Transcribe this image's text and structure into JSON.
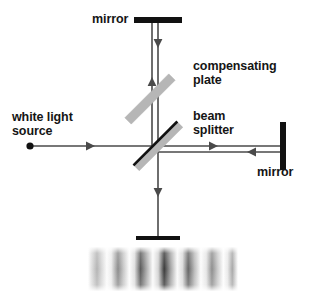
{
  "figure": {
    "background_color": "#ffffff",
    "line_color": "#4a4a4a",
    "solid_black": "#111111",
    "plate_gray": "#b3b3b3",
    "text_color": "#151515",
    "width": 312,
    "height": 308
  },
  "labels": {
    "mirror_top": "mirror",
    "compensating_plate": "compensating\nplate",
    "beam_splitter": "beam\nsplitter",
    "white_light_source": "white light\nsource",
    "mirror_right": "mirror"
  },
  "components": [
    {
      "name": "white-light-source",
      "kind": "point-source",
      "x": 30,
      "y": 146
    },
    {
      "name": "beam-splitter",
      "kind": "tilted-plate",
      "angle_deg": -45,
      "center_x": 158,
      "center_y": 146,
      "length": 62,
      "thickness": 8,
      "has_coating_line": true
    },
    {
      "name": "compensating-plate",
      "kind": "tilted-plate",
      "angle_deg": -45,
      "center_x": 150,
      "center_y": 99,
      "length": 62,
      "thickness": 8,
      "has_coating_line": false
    },
    {
      "name": "mirror-top",
      "kind": "bar-horizontal",
      "center_x": 158,
      "center_y": 20,
      "length": 48,
      "thickness": 6
    },
    {
      "name": "mirror-right",
      "kind": "bar-vertical",
      "center_x": 283,
      "center_y": 146,
      "length": 48,
      "thickness": 6
    },
    {
      "name": "detector-screen",
      "kind": "bar-horizontal",
      "center_x": 158,
      "center_y": 238,
      "length": 44,
      "thickness": 4
    }
  ],
  "beams": [
    {
      "name": "source-to-splitter",
      "from_x": 30,
      "from_y": 146,
      "to_x": 158,
      "to_y": 146,
      "arrow_positions": [
        0.49
      ],
      "direction": "right"
    },
    {
      "name": "splitter-to-mirror-right",
      "from_x": 158,
      "from_y": 146,
      "to_x": 283,
      "to_y": 146,
      "arrow_positions": [
        0.46
      ],
      "direction": "right"
    },
    {
      "name": "mirror-right-to-splitter",
      "from_x": 283,
      "from_y": 152,
      "to_x": 158,
      "to_y": 152,
      "arrow_positions": [
        0.25
      ],
      "direction": "left"
    },
    {
      "name": "splitter-to-mirror-top",
      "from_x": 152,
      "from_y": 146,
      "to_x": 152,
      "to_y": 20,
      "arrow_positions": [
        0.55
      ],
      "direction": "up"
    },
    {
      "name": "mirror-top-to-splitter",
      "from_x": 158,
      "from_y": 20,
      "to_x": 158,
      "to_y": 146,
      "arrow_positions": [
        0.15
      ],
      "direction": "down"
    },
    {
      "name": "splitter-to-screen",
      "from_x": 158,
      "from_y": 146,
      "to_x": 158,
      "to_y": 238,
      "arrow_positions": [
        0.55
      ],
      "direction": "down"
    }
  ],
  "fringe_pattern": {
    "name": "interference-fringes",
    "x": 88,
    "y": 247,
    "width": 150,
    "height": 44,
    "band_count": 7,
    "description": "vertical interference fringes, darkest near center, fading toward the edges",
    "band_darkness": [
      0.45,
      0.7,
      0.88,
      1.0,
      0.82,
      0.58,
      0.42
    ]
  }
}
